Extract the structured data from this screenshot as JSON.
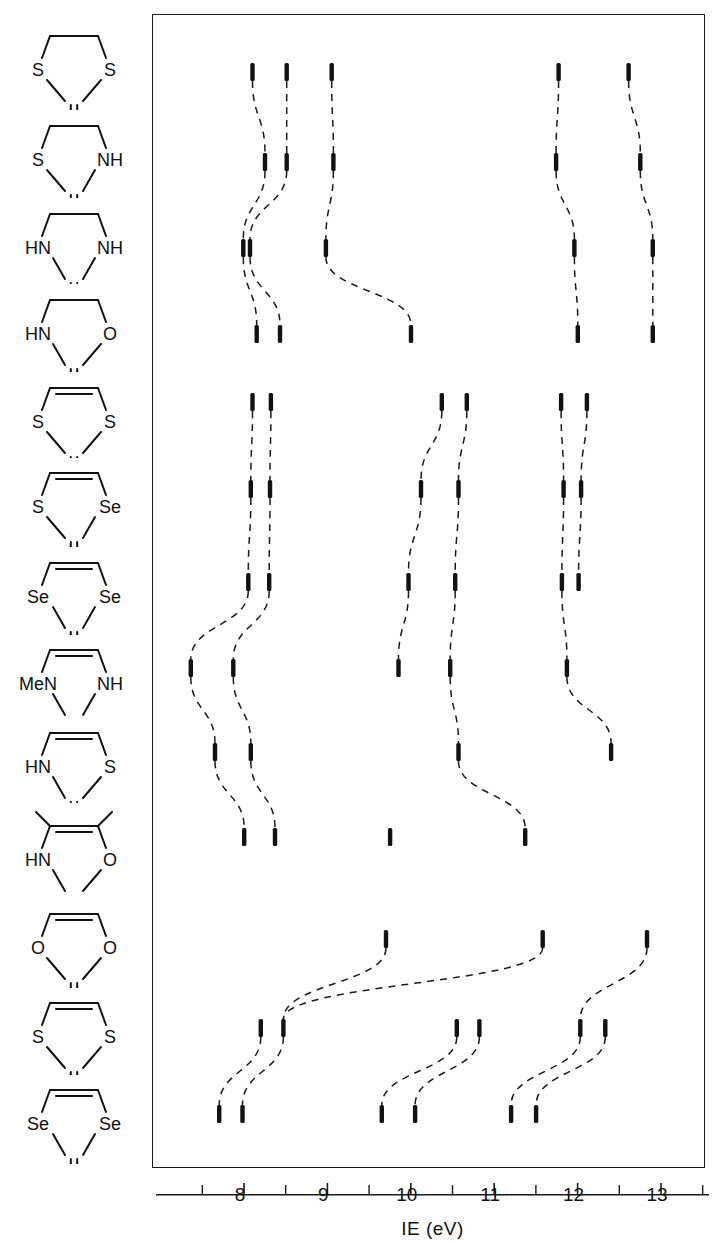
{
  "figure": {
    "axis_title": "IE (eV)",
    "x_label_tokens": [
      "I",
      "E",
      "(eV)"
    ]
  },
  "chart_data": {
    "type": "scatter",
    "title": "",
    "xlabel": "IE (eV)",
    "ylabel": "",
    "xlim": [
      7.45,
      13.55
    ],
    "ylim_note": "categorical rows of molecules, no y scale",
    "grid": false,
    "legend": "none",
    "xticks_major": [
      8,
      9,
      10,
      11,
      12,
      13
    ],
    "xtick_labels": [
      "8",
      "9",
      "10",
      "11",
      "12",
      "13"
    ],
    "xticks_minor": [
      7.5,
      8.5,
      9.5,
      10.5,
      11.5,
      12.5,
      13.5
    ],
    "marker_style": "vertical bar",
    "connector_style": "dashed line between corresponding bands of adjacent rows",
    "groups": [
      {
        "name": "saturated 5-ring thiones",
        "row_indices": [
          0,
          1,
          2,
          3
        ]
      },
      {
        "name": "unsaturated 5-ring thiones",
        "row_indices": [
          4,
          5,
          6,
          7,
          8,
          9
        ]
      },
      {
        "name": "1,3-dichalcogenole-2-chalcogenones and vinylene carbonate",
        "row_indices": [
          10,
          11,
          12
        ]
      }
    ],
    "rows": [
      {
        "label": "1,3-dithiolane-2-thione",
        "structure": {
          "ring": [
            "S",
            "S"
          ],
          "exocyclic": "S",
          "top_bond": "single",
          "substituents": []
        },
        "values": [
          8.15,
          8.56,
          9.1,
          11.82,
          12.66
        ]
      },
      {
        "label": "1,3-thiazolidine-2-thione",
        "structure": {
          "ring": [
            "S",
            "NH"
          ],
          "exocyclic": "S",
          "top_bond": "single",
          "substituents": []
        },
        "values": [
          8.3,
          8.56,
          9.12,
          11.79,
          12.8
        ]
      },
      {
        "label": "imidazolidine-2-thione",
        "structure": {
          "ring": [
            "HN",
            "NH"
          ],
          "exocyclic": "S",
          "top_bond": "single",
          "substituents": []
        },
        "values": [
          8.04,
          8.12,
          9.03,
          12.01,
          12.95
        ]
      },
      {
        "label": "1,3-oxazolidine-2-thione",
        "structure": {
          "ring": [
            "HN",
            "O"
          ],
          "exocyclic": "S",
          "top_bond": "single",
          "substituents": []
        },
        "values": [
          8.2,
          8.48,
          10.05,
          12.05,
          12.95
        ]
      },
      {
        "label": "1,3-dithiole-2-thione",
        "structure": {
          "ring": [
            "S",
            "S"
          ],
          "exocyclic": "S",
          "top_bond": "double",
          "substituents": []
        },
        "values": [
          8.15,
          8.37,
          10.42,
          10.72,
          11.85,
          12.16
        ]
      },
      {
        "label": "1,3-thiaselenole-2-thione",
        "structure": {
          "ring": [
            "S",
            "Se"
          ],
          "exocyclic": "S",
          "top_bond": "double",
          "substituents": []
        },
        "values": [
          8.13,
          8.36,
          10.17,
          10.62,
          11.88,
          12.09
        ]
      },
      {
        "label": "1,3-diselenole-2-thione",
        "structure": {
          "ring": [
            "Se",
            "Se"
          ],
          "exocyclic": "S",
          "top_bond": "double",
          "substituents": []
        },
        "values": [
          8.1,
          8.35,
          10.02,
          10.58,
          11.86,
          12.06
        ]
      },
      {
        "label": "1-methylimidazole-2-thione",
        "structure": {
          "ring": [
            "MeN",
            "NH"
          ],
          "exocyclic": "S",
          "top_bond": "double",
          "substituents": []
        },
        "values": [
          7.41,
          7.92,
          9.9,
          10.52,
          11.92
        ]
      },
      {
        "label": "1,3-thiazole-2-thione",
        "structure": {
          "ring": [
            "HN",
            "S"
          ],
          "exocyclic": "S",
          "top_bond": "double",
          "substituents": []
        },
        "values": [
          7.7,
          8.13,
          10.62,
          12.45
        ]
      },
      {
        "label": "4,5-dimethyl-1,3-oxazole-2-thione",
        "structure": {
          "ring": [
            "HN",
            "O"
          ],
          "exocyclic": "S",
          "top_bond": "double",
          "substituents": [
            "Me",
            "Me"
          ]
        },
        "values": [
          8.05,
          8.42,
          9.8,
          11.42
        ]
      },
      {
        "label": "vinylene carbonate",
        "structure": {
          "ring": [
            "O",
            "O"
          ],
          "exocyclic": "O",
          "top_bond": "double",
          "substituents": []
        },
        "values": [
          9.75,
          11.63,
          12.88
        ]
      },
      {
        "label": "1,3-dithiole-2-thione (planar)",
        "structure": {
          "ring": [
            "S",
            "S"
          ],
          "exocyclic": "S",
          "top_bond": "double",
          "substituents": []
        },
        "values": [
          8.25,
          8.52,
          10.6,
          10.87,
          12.08,
          12.38
        ]
      },
      {
        "label": "1,3-diselenole-2-selone",
        "structure": {
          "ring": [
            "Se",
            "Se"
          ],
          "exocyclic": "Se",
          "top_bond": "double",
          "substituents": []
        },
        "values": [
          7.75,
          8.03,
          9.7,
          10.1,
          11.25,
          11.55
        ]
      }
    ],
    "row_y_px": [
      58,
      148,
      234,
      320,
      388,
      475,
      568,
      654,
      738,
      823,
      925,
      1014,
      1100
    ],
    "connections": [
      {
        "from_row": 0,
        "to_row": 1,
        "pairs": [
          [
            0,
            0
          ],
          [
            1,
            1
          ],
          [
            2,
            2
          ],
          [
            3,
            3
          ],
          [
            4,
            4
          ]
        ]
      },
      {
        "from_row": 1,
        "to_row": 2,
        "pairs": [
          [
            0,
            0
          ],
          [
            1,
            1
          ],
          [
            2,
            2
          ],
          [
            3,
            3
          ],
          [
            4,
            4
          ]
        ]
      },
      {
        "from_row": 2,
        "to_row": 3,
        "pairs": [
          [
            0,
            0
          ],
          [
            1,
            1
          ],
          [
            2,
            2
          ],
          [
            3,
            3
          ],
          [
            4,
            4
          ]
        ]
      },
      {
        "from_row": 4,
        "to_row": 5,
        "pairs": [
          [
            0,
            0
          ],
          [
            1,
            1
          ],
          [
            2,
            2
          ],
          [
            3,
            3
          ],
          [
            4,
            4
          ],
          [
            5,
            5
          ]
        ]
      },
      {
        "from_row": 5,
        "to_row": 6,
        "pairs": [
          [
            0,
            0
          ],
          [
            1,
            1
          ],
          [
            2,
            2
          ],
          [
            3,
            3
          ],
          [
            4,
            4
          ],
          [
            5,
            5
          ]
        ]
      },
      {
        "from_row": 6,
        "to_row": 7,
        "pairs": [
          [
            0,
            0
          ],
          [
            1,
            1
          ],
          [
            2,
            2
          ],
          [
            3,
            3
          ],
          [
            4,
            4
          ]
        ]
      },
      {
        "from_row": 7,
        "to_row": 8,
        "pairs": [
          [
            0,
            0
          ],
          [
            1,
            1
          ],
          [
            3,
            2
          ],
          [
            4,
            3
          ]
        ]
      },
      {
        "from_row": 8,
        "to_row": 9,
        "pairs": [
          [
            0,
            0
          ],
          [
            1,
            1
          ],
          [
            2,
            3
          ]
        ]
      },
      {
        "from_row": 10,
        "to_row": 11,
        "pairs": [
          [
            0,
            1
          ],
          [
            1,
            1
          ],
          [
            2,
            4
          ]
        ]
      },
      {
        "from_row": 11,
        "to_row": 12,
        "pairs": [
          [
            0,
            0
          ],
          [
            1,
            1
          ],
          [
            2,
            2
          ],
          [
            3,
            3
          ],
          [
            4,
            4
          ],
          [
            5,
            5
          ]
        ]
      }
    ]
  }
}
